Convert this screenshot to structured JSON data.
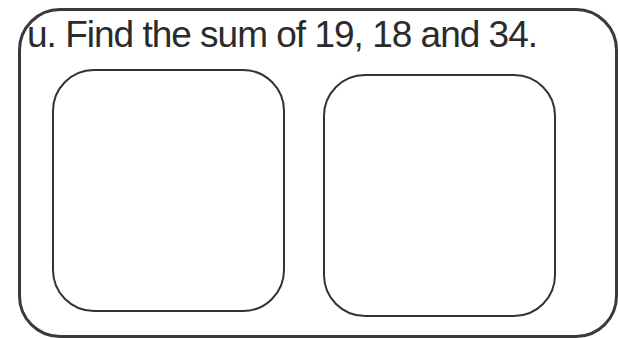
{
  "question": {
    "label": "u.",
    "text": "u. Find the sum of 19, 18 and 34."
  },
  "answer_boxes": [
    {
      "content": ""
    },
    {
      "content": ""
    }
  ]
}
